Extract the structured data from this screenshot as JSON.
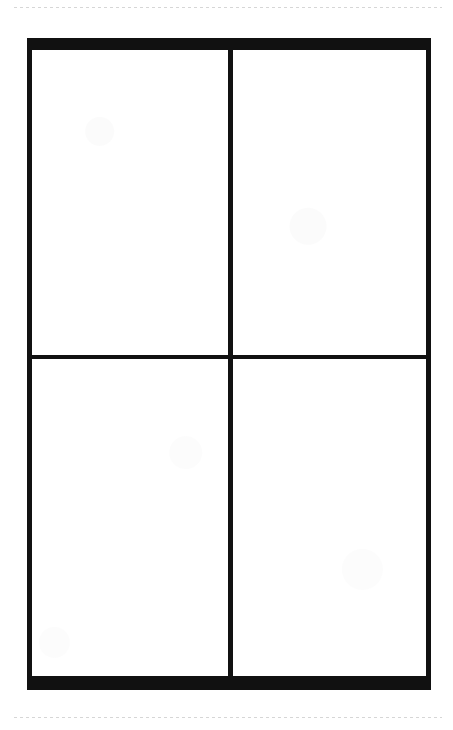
{
  "page": {
    "background_color": "#ffffff",
    "width": 453,
    "height": 730
  },
  "scan_guides": {
    "top_label": "scan edge guide top",
    "bottom_label": "scan edge guide bottom",
    "color": "#cfcfcf",
    "style": "dashed"
  },
  "frame": {
    "label": "four panel grid frame",
    "border_color": "#111111",
    "top_rail_label": "top rail",
    "bottom_rail_label": "bottom rail",
    "left_stile_label": "left border",
    "right_stile_label": "right border",
    "center_mullion_label": "center vertical divider",
    "mid_transom_label": "middle horizontal divider"
  },
  "panes": [
    {
      "id": "r1c1",
      "label": "top left panel",
      "content": "",
      "fill": "#ffffff"
    },
    {
      "id": "r1c2",
      "label": "top right panel",
      "content": "",
      "fill": "#ffffff"
    },
    {
      "id": "r2c1",
      "label": "bottom left panel",
      "content": "",
      "fill": "#ffffff"
    },
    {
      "id": "r2c2",
      "label": "bottom right panel",
      "content": "",
      "fill": "#ffffff"
    }
  ],
  "caption": "Blank two-by-two grid with heavy black rules and four empty white cells"
}
